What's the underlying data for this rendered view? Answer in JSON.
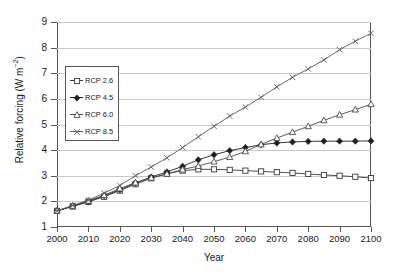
{
  "chart_data": {
    "type": "line",
    "title": "",
    "xlabel": "Year",
    "ylabel": "Relative forcing (W m-2)",
    "ylabel_prefix": "Relative forcing (W m",
    "ylabel_sup": "−2",
    "ylabel_suffix": ")",
    "xlim": [
      2000,
      2100
    ],
    "ylim": [
      1,
      9
    ],
    "xticks": [
      2000,
      2010,
      2020,
      2030,
      2040,
      2050,
      2060,
      2070,
      2080,
      2090,
      2100
    ],
    "yticks": [
      1,
      2,
      3,
      4,
      5,
      6,
      7,
      8,
      9
    ],
    "grid": "horizontal",
    "legend_position": "upper-left-inside",
    "x": [
      2000,
      2005,
      2010,
      2015,
      2020,
      2025,
      2030,
      2035,
      2040,
      2045,
      2050,
      2055,
      2060,
      2065,
      2070,
      2075,
      2080,
      2085,
      2090,
      2095,
      2100
    ],
    "series": [
      {
        "name": "RCP 2.6",
        "marker": "open-square",
        "color": "#3a3a3a",
        "values": [
          1.63,
          1.8,
          1.98,
          2.18,
          2.42,
          2.67,
          2.9,
          3.08,
          3.2,
          3.25,
          3.25,
          3.23,
          3.2,
          3.17,
          3.14,
          3.11,
          3.07,
          3.03,
          3.0,
          2.96,
          2.91
        ]
      },
      {
        "name": "RCP 4.5",
        "marker": "filled-diamond",
        "color": "#1f1f1f",
        "values": [
          1.63,
          1.82,
          2.0,
          2.22,
          2.45,
          2.72,
          2.95,
          3.15,
          3.37,
          3.62,
          3.82,
          3.98,
          4.1,
          4.21,
          4.28,
          4.32,
          4.34,
          4.35,
          4.35,
          4.35,
          4.36
        ]
      },
      {
        "name": "RCP 6.0",
        "marker": "open-triangle",
        "color": "#4a4a4a",
        "values": [
          1.63,
          1.82,
          2.02,
          2.24,
          2.5,
          2.73,
          2.92,
          3.07,
          3.24,
          3.38,
          3.55,
          3.73,
          3.95,
          4.22,
          4.47,
          4.7,
          4.93,
          5.16,
          5.38,
          5.58,
          5.79
        ]
      },
      {
        "name": "RCP 8.5",
        "marker": "cross",
        "color": "#5a5a5a",
        "values": [
          1.63,
          1.84,
          2.05,
          2.32,
          2.62,
          3.0,
          3.34,
          3.7,
          4.1,
          4.52,
          4.93,
          5.33,
          5.68,
          6.06,
          6.47,
          6.84,
          7.17,
          7.52,
          7.92,
          8.25,
          8.56
        ]
      }
    ]
  }
}
